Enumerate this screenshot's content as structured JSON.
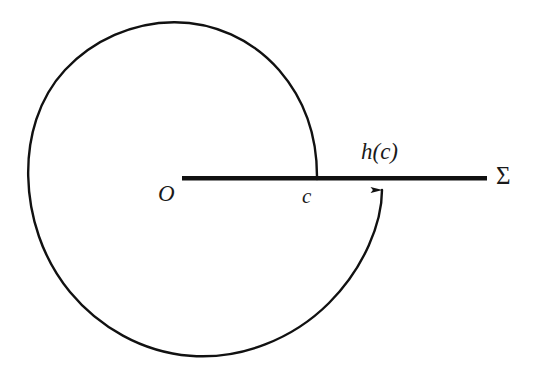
{
  "figure": {
    "kind": "mathematical-diagram",
    "background_color": "#ffffff",
    "stroke_color": "#111111"
  },
  "labels": {
    "origin": "O",
    "crossing_point": "c",
    "map_image": "h(c)",
    "ray": "Σ"
  },
  "geometry": {
    "canvas": {
      "width": 541,
      "height": 374
    },
    "spiral": {
      "center": {
        "x": 174,
        "y": 189
      },
      "start_point": {
        "x": 317,
        "y": 179
      },
      "end_point": {
        "x": 382,
        "y": 180
      },
      "start_radius": 143,
      "end_radius": 208,
      "turn_direction": "counter-clockwise",
      "stroke_width": 2.4,
      "path": "M 317 179 C 317 104 266 40 196 25 C 118 9 35 71 29 160 C 23 252 77 327 160 351 C 256 378 368 296 382 184"
    },
    "ray": {
      "label": "Σ",
      "start": {
        "x": 182,
        "y": 178
      },
      "end": {
        "x": 487,
        "y": 178
      },
      "stroke_width": 4.4
    },
    "arrow": {
      "tip": {
        "x": 382,
        "y": 180
      },
      "direction": "up",
      "head_width": 9,
      "head_length": 13
    },
    "tick_marks": [
      {
        "name": "c",
        "x": 317,
        "y": 178
      }
    ]
  },
  "label_positions": {
    "origin": {
      "x": 165,
      "y": 195
    },
    "crossing_point": {
      "x": 308,
      "y": 196
    },
    "map_image": {
      "x": 390,
      "y": 156
    },
    "ray": {
      "x": 509,
      "y": 178
    }
  }
}
